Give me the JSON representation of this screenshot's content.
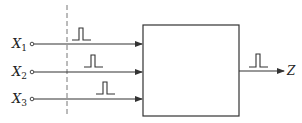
{
  "diagram": {
    "inputs": [
      {
        "label": "X",
        "subscript": "1"
      },
      {
        "label": "X",
        "subscript": "2"
      },
      {
        "label": "X",
        "subscript": "3"
      }
    ],
    "output": {
      "label": "Z"
    },
    "colors": {
      "stroke": "#333333",
      "dashed": "#777777",
      "background": "#ffffff"
    }
  }
}
